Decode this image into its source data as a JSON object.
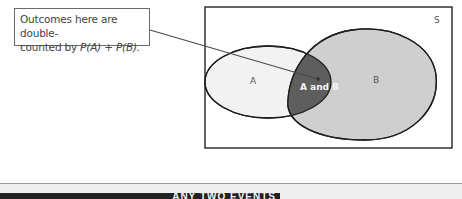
{
  "callout": {
    "line1": "Outcomes here are double-",
    "line2_prefix": "counted by ",
    "formula": "P(A) + P(B)."
  },
  "venn": {
    "sample_space_label": "S",
    "set_a_label": "A",
    "set_b_label": "B",
    "intersection_label": "A and B",
    "colors": {
      "a_fill": "#f2f2f2",
      "b_fill": "#cfcfcf",
      "intersection_fill": "#5e5e5e",
      "outline": "#1e1e1e"
    }
  },
  "section_header": {
    "text": "ANY TWO EVENTS",
    "bar_color": "#222222"
  }
}
